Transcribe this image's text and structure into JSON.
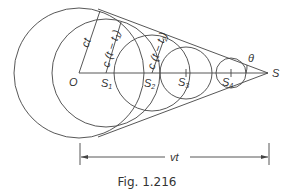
{
  "figure": {
    "caption": "Fig. 1.216",
    "labels": {
      "origin": "O",
      "source": "S",
      "s1": "S",
      "s1_sub": "1",
      "s2": "S",
      "s2_sub": "2",
      "s3": "S",
      "s3_sub": "3",
      "s4": "S",
      "s4_sub": "4",
      "angle": "θ",
      "radius_o": "ct",
      "radius_s1": "c (t − t",
      "radius_s1_sub": "1",
      "radius_s1_end": ")",
      "radius_s2": "c (t − t",
      "radius_s2_sub": "2",
      "radius_s2_end": ")",
      "distance": "vt"
    },
    "stroke_color": "#444444"
  }
}
